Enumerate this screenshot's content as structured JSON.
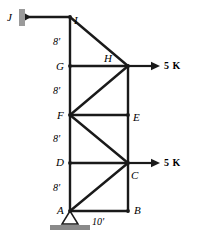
{
  "figure": {
    "width": 203,
    "height": 236,
    "line_color": "#1a1a1a",
    "support_color": "#9a9a9a",
    "ground_color": "#8a8a8a"
  },
  "joints": [
    {
      "id": "A",
      "label": "A",
      "x": 70,
      "y": 211,
      "label_x": 57,
      "label_y": 205
    },
    {
      "id": "B",
      "label": "B",
      "x": 128,
      "y": 211,
      "label_x": 134,
      "label_y": 205
    },
    {
      "id": "C",
      "label": "C",
      "x": 128,
      "y": 163,
      "label_x": 131,
      "label_y": 170
    },
    {
      "id": "D",
      "label": "D",
      "x": 70,
      "y": 163,
      "label_x": 56,
      "label_y": 157
    },
    {
      "id": "E",
      "label": "E",
      "x": 128,
      "y": 115,
      "label_x": 133,
      "label_y": 112
    },
    {
      "id": "F",
      "label": "F",
      "x": 70,
      "y": 115,
      "label_x": 57,
      "label_y": 110
    },
    {
      "id": "G",
      "label": "G",
      "x": 70,
      "y": 66,
      "label_x": 56,
      "label_y": 61
    },
    {
      "id": "H",
      "label": "H",
      "x": 128,
      "y": 66,
      "label_x": 104,
      "label_y": 53
    },
    {
      "id": "I",
      "label": "I",
      "x": 70,
      "y": 17,
      "label_x": 74,
      "label_y": 15
    },
    {
      "id": "J",
      "label": "J",
      "x": 25,
      "y": 17,
      "label_x": 7,
      "label_y": 12
    }
  ],
  "members": [
    {
      "name": "J-I",
      "from": "J",
      "to": "I"
    },
    {
      "name": "I-G",
      "from": "I",
      "to": "G"
    },
    {
      "name": "G-F",
      "from": "G",
      "to": "F"
    },
    {
      "name": "F-D",
      "from": "F",
      "to": "D"
    },
    {
      "name": "D-A",
      "from": "D",
      "to": "A"
    },
    {
      "name": "H-E",
      "from": "H",
      "to": "E"
    },
    {
      "name": "E-C",
      "from": "E",
      "to": "C"
    },
    {
      "name": "C-B",
      "from": "C",
      "to": "B"
    },
    {
      "name": "G-H",
      "from": "G",
      "to": "H"
    },
    {
      "name": "F-E",
      "from": "F",
      "to": "E"
    },
    {
      "name": "D-C",
      "from": "D",
      "to": "C"
    },
    {
      "name": "A-B",
      "from": "A",
      "to": "B"
    },
    {
      "name": "I-H",
      "from": "I",
      "to": "H"
    },
    {
      "name": "F-H",
      "from": "F",
      "to": "H"
    },
    {
      "name": "F-C",
      "from": "F",
      "to": "C"
    },
    {
      "name": "A-C",
      "from": "A",
      "to": "C"
    }
  ],
  "dimensions": [
    {
      "name": "panel-I-G",
      "text": "8'",
      "x": 53,
      "y": 37
    },
    {
      "name": "panel-G-F",
      "text": "8'",
      "x": 53,
      "y": 86
    },
    {
      "name": "panel-F-D",
      "text": "8'",
      "x": 53,
      "y": 134
    },
    {
      "name": "panel-D-A",
      "text": "8'",
      "x": 53,
      "y": 183
    },
    {
      "name": "span-A-B",
      "text": "10'",
      "x": 92,
      "y": 217
    }
  ],
  "loads": [
    {
      "name": "load-at-H",
      "text": "5 K",
      "joint": "H",
      "arrow_x1": 128,
      "arrow_y1": 66,
      "arrow_x2": 160,
      "arrow_y2": 66,
      "label_x": 164,
      "label_y": 61
    },
    {
      "name": "load-at-C",
      "text": "5 K",
      "joint": "C",
      "arrow_x1": 128,
      "arrow_y1": 163,
      "arrow_x2": 160,
      "arrow_y2": 163,
      "label_x": 164,
      "label_y": 158
    }
  ],
  "supports": {
    "wall": {
      "name": "wall-support-at-J",
      "joint": "J",
      "x": 19,
      "y": 9,
      "width": 6,
      "height": 17
    },
    "pin": {
      "name": "pin-support-at-A",
      "joint": "A",
      "apex_x": 70,
      "apex_y": 211,
      "base_left_x": 62,
      "base_right_x": 78,
      "base_y": 224,
      "ground_x": 50,
      "ground_y": 225,
      "ground_width": 40,
      "ground_height": 5
    }
  }
}
